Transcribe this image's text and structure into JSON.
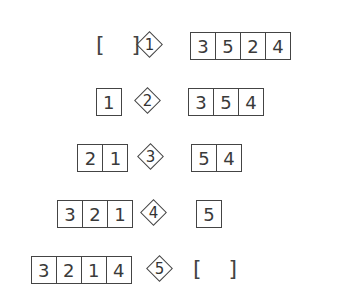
{
  "steps": [
    {
      "step": "1",
      "left": [],
      "right": [
        "3",
        "5",
        "2",
        "4"
      ]
    },
    {
      "step": "2",
      "left": [
        "1"
      ],
      "right": [
        "3",
        "5",
        "4"
      ]
    },
    {
      "step": "3",
      "left": [
        "2",
        "1"
      ],
      "right": [
        "5",
        "4"
      ]
    },
    {
      "step": "4",
      "left": [
        "3",
        "2",
        "1"
      ],
      "right": [
        "5"
      ]
    },
    {
      "step": "5",
      "left": [
        "3",
        "2",
        "1",
        "4"
      ],
      "right": []
    }
  ],
  "empty_label": "[ ]"
}
